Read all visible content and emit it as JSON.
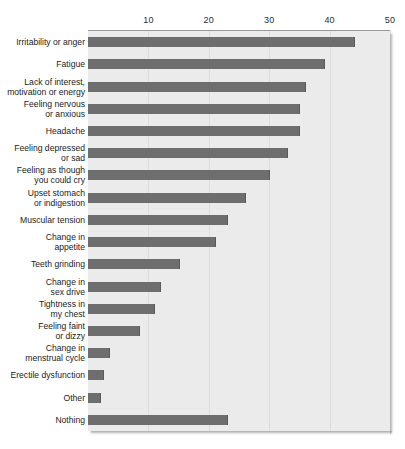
{
  "chart_data": {
    "type": "bar",
    "orientation": "horizontal",
    "title": "",
    "xlabel": "",
    "ylabel": "",
    "xlim": [
      0,
      50
    ],
    "xticks": [
      10,
      20,
      30,
      40,
      50
    ],
    "xtick_labels": [
      "10",
      "20",
      "30",
      "40",
      "50"
    ],
    "grid": true,
    "legend": "none",
    "bar_color": "#6e6e6e",
    "plot_background": "#ebebeb",
    "categories": [
      "Irritability or anger",
      "Fatigue",
      "Lack of interest,\nmotivation or energy",
      "Feeling nervous\nor anxious",
      "Headache",
      "Feeling depressed\nor sad",
      "Feeling as though\nyou could cry",
      "Upset stomach\nor indigestion",
      "Muscular tension",
      "Change in\nappetite",
      "Teeth grinding",
      "Change in\nsex drive",
      "Tightness in\nmy chest",
      "Feeling faint\nor dizzy",
      "Change in\nmenstrual cycle",
      "Erectile dysfunction",
      "Other",
      "Nothing"
    ],
    "values": [
      44,
      39,
      36,
      35,
      35,
      33,
      30,
      26,
      23,
      21,
      15,
      12,
      11,
      8.5,
      3.5,
      2.5,
      2,
      23
    ]
  }
}
